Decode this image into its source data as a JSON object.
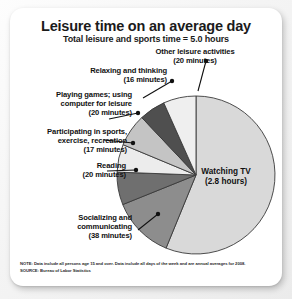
{
  "chart_data": {
    "type": "pie",
    "title": "Leisure time on an average day",
    "subtitle": "Total leisure and sports time = 5.0 hours",
    "total_minutes": 300,
    "categories": [
      "Watching TV",
      "Socializing and communicating",
      "Reading",
      "Participating in sports, exercise, recreation",
      "Playing games; using computer for leisure",
      "Relaxing and thinking",
      "Other leisure activities"
    ],
    "values": [
      168,
      38,
      20,
      17,
      20,
      16,
      20
    ],
    "value_labels": [
      "(2.8 hours)",
      "(38 minutes)",
      "(20 minutes)",
      "(17 minutes)",
      "(20 minutes)",
      "(16 minutes)",
      "(20 minutes)"
    ],
    "slice_colors": [
      "#d9d9d9",
      "#8d8d8d",
      "#6f6f6f",
      "#ececec",
      "#c4c4c4",
      "#4f4f4f",
      "#efefef"
    ],
    "legend": "none",
    "grid": false,
    "xlabel": "",
    "ylabel": ""
  },
  "callouts": {
    "other_leisure": "Other leisure activities\n(20 minutes)",
    "relaxing": "Relaxing and thinking\n(16 minutes)",
    "playing_games": "Playing games; using\ncomputer for leisure\n(20 minutes)",
    "sports": "Participating in sports,\nexercise, recreation\n(17 minutes)",
    "reading": "Reading\n(20 minutes)",
    "socializing": "Socializing and\ncommunicating\n(38 minutes)",
    "watching_tv": "Watching TV\n(2.8 hours)"
  },
  "footnotes": {
    "note": "NOTE: Data include all persons age 15 and over. Data include all days of the week and are annual averages for 2008.",
    "source": "SOURCE: Bureau of Labor Statistics"
  }
}
